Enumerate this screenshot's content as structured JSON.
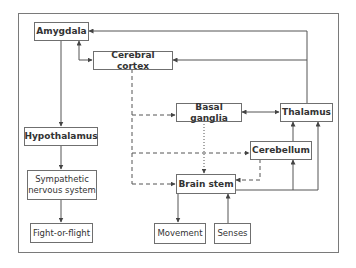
{
  "diagram": {
    "nodes": {
      "amygdala": {
        "label": "Amygdala",
        "bold": true
      },
      "cerebral_cortex": {
        "label": "Cerebral cortex",
        "bold": true
      },
      "basal_ganglia": {
        "label": "Basal ganglia",
        "bold": true
      },
      "thalamus": {
        "label": "Thalamus",
        "bold": true
      },
      "hypothalamus": {
        "label": "Hypothalamus",
        "bold": true
      },
      "cerebellum": {
        "label": "Cerebellum",
        "bold": true
      },
      "brain_stem": {
        "label": "Brain stem",
        "bold": true
      },
      "sympathetic": {
        "label_line1": "Sympathetic",
        "label_line2": "nervous system",
        "bold": false
      },
      "fight_or_flight": {
        "label": "Fight-or-flight",
        "bold": false
      },
      "movement": {
        "label": "Movement",
        "bold": false
      },
      "senses": {
        "label": "Senses",
        "bold": false
      }
    },
    "edges": [
      {
        "from": "Thalamus",
        "to": "Amygdala",
        "style": "solid"
      },
      {
        "from": "Thalamus",
        "to": "Cerebral cortex",
        "style": "solid"
      },
      {
        "from": "Amygdala",
        "to": "Cerebral cortex",
        "style": "solid",
        "bidirectional": true
      },
      {
        "from": "Amygdala",
        "to": "Hypothalamus",
        "style": "solid"
      },
      {
        "from": "Hypothalamus",
        "to": "Sympathetic nervous system",
        "style": "solid"
      },
      {
        "from": "Sympathetic nervous system",
        "to": "Fight-or-flight",
        "style": "solid"
      },
      {
        "from": "Cerebral cortex",
        "to": "Basal ganglia",
        "style": "dashed"
      },
      {
        "from": "Cerebral cortex",
        "to": "Cerebellum",
        "style": "dashed"
      },
      {
        "from": "Cerebral cortex",
        "to": "Brain stem",
        "style": "dashed"
      },
      {
        "from": "Basal ganglia",
        "to": "Thalamus",
        "style": "solid",
        "bidirectional": true
      },
      {
        "from": "Basal ganglia",
        "to": "Brain stem",
        "style": "dotted"
      },
      {
        "from": "Cerebellum",
        "to": "Brain stem",
        "style": "dashed"
      },
      {
        "from": "Cerebellum",
        "to": "Thalamus",
        "style": "solid"
      },
      {
        "from": "Brain stem",
        "to": "Thalamus",
        "style": "solid"
      },
      {
        "from": "Brain stem",
        "to": "Cerebellum",
        "style": "solid"
      },
      {
        "from": "Brain stem",
        "to": "Movement",
        "style": "solid"
      },
      {
        "from": "Senses",
        "to": "Brain stem",
        "style": "solid"
      }
    ],
    "colors": {
      "line": "#555555",
      "border": "#6f6f6f",
      "text": "#333333",
      "background": "#ffffff"
    }
  }
}
